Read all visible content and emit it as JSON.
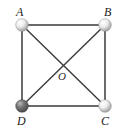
{
  "figure": {
    "type": "geometry-diagram",
    "background_color": "#ffffff",
    "edge_color": "#3a3a3a",
    "edge_width": 1.4,
    "labels": {
      "A": "A",
      "B": "B",
      "C": "C",
      "D": "D",
      "O": "O"
    },
    "vertices": [
      {
        "id": "A",
        "label": "A",
        "x": 22,
        "y": 25,
        "radius": 6.5,
        "fill": "#e8e8e8",
        "shade": "#a8a8a8",
        "highlight": "#ffffff",
        "label_x": 16,
        "label_y": 6
      },
      {
        "id": "B",
        "label": "B",
        "x": 105,
        "y": 25,
        "radius": 6.5,
        "fill": "#e8e8e8",
        "shade": "#a8a8a8",
        "highlight": "#ffffff",
        "label_x": 104,
        "label_y": 6
      },
      {
        "id": "C",
        "label": "C",
        "x": 105,
        "y": 106,
        "radius": 6.5,
        "fill": "#e8e8e8",
        "shade": "#a8a8a8",
        "highlight": "#ffffff",
        "label_x": 101,
        "label_y": 115
      },
      {
        "id": "D",
        "label": "D",
        "x": 22,
        "y": 106,
        "radius": 6.5,
        "fill": "#6e6e6e",
        "shade": "#4a4a4a",
        "highlight": "#b5b5b5",
        "label_x": 17,
        "label_y": 115
      }
    ],
    "center_point": {
      "id": "O",
      "label": "O",
      "x": 63.5,
      "y": 65.5,
      "label_x": 58,
      "label_y": 71
    },
    "edges": [
      {
        "id": "AB",
        "from": "A",
        "to": "B",
        "kind": "side"
      },
      {
        "id": "BC",
        "from": "B",
        "to": "C",
        "kind": "side"
      },
      {
        "id": "CD",
        "from": "C",
        "to": "D",
        "kind": "side"
      },
      {
        "id": "DA",
        "from": "D",
        "to": "A",
        "kind": "side"
      },
      {
        "id": "AC",
        "from": "A",
        "to": "C",
        "kind": "diagonal"
      },
      {
        "id": "BD",
        "from": "B",
        "to": "D",
        "kind": "diagonal"
      }
    ]
  }
}
